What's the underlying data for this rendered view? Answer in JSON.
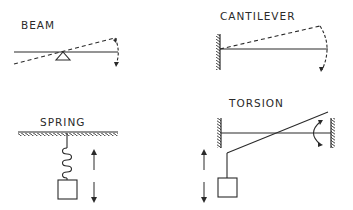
{
  "figure": {
    "panels": [
      {
        "id": "beam",
        "label": "BEAM"
      },
      {
        "id": "cantilever",
        "label": "CANTILEVER"
      },
      {
        "id": "spring",
        "label": "SPRING"
      },
      {
        "id": "torsion",
        "label": "TORSION"
      }
    ]
  },
  "colors": {
    "ink": "#2a2a2a",
    "background": "#ffffff"
  }
}
